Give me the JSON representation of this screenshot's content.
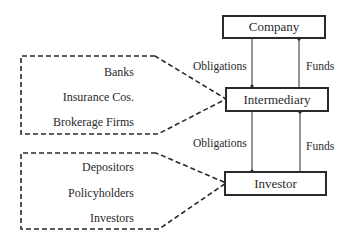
{
  "nodes": {
    "company": {
      "label": "Company"
    },
    "intermediary": {
      "label": "Intermediary"
    },
    "investor": {
      "label": "Investor"
    }
  },
  "flows": [
    {
      "from": "company",
      "to": "intermediary",
      "left_label": "Obligations",
      "right_label": "Funds"
    },
    {
      "from": "intermediary",
      "to": "investor",
      "left_label": "Obligations",
      "right_label": "Funds"
    }
  ],
  "groups": {
    "intermediary_examples": {
      "items": [
        "Banks",
        "Insurance Cos.",
        "Brokerage Firms"
      ]
    },
    "investor_examples": {
      "items": [
        "Depositors",
        "Policyholders",
        "Investors"
      ]
    }
  },
  "colors": {
    "stroke": "#2a2a2a",
    "background": "#ffffff"
  }
}
